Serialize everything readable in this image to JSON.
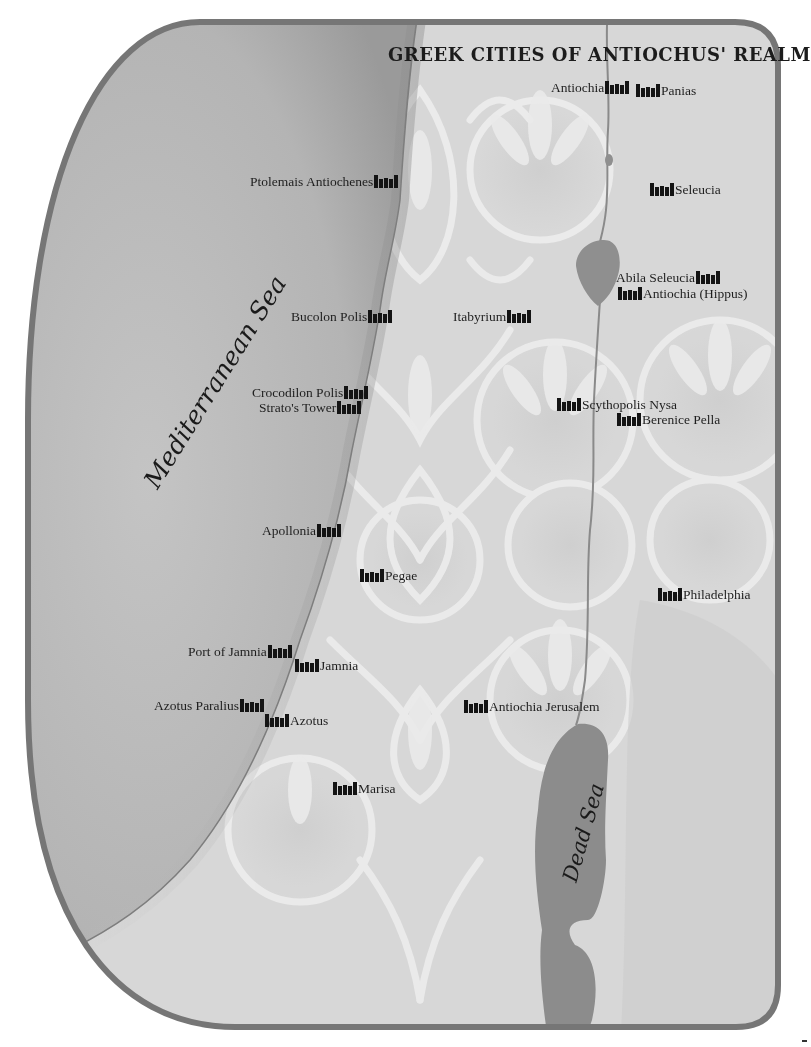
{
  "map": {
    "title": "GREEK CITIES OF ANTIOCHUS' REALM",
    "colors": {
      "frame_border": "#767676",
      "sea": "#b9b9b9",
      "land": "#d6d6d6",
      "ornament": "#e9e9e9",
      "lake": "#8f8f8f",
      "river": "#8a8a8a",
      "text": "#1e1e1e"
    },
    "water_bodies": [
      {
        "name": "Mediterranean Sea"
      },
      {
        "name": "Dead Sea"
      }
    ],
    "icons": {
      "city_marker": "fortress-icon"
    },
    "cities": [
      {
        "name": "Antiochia",
        "side": "left",
        "x": 550,
        "y": 80
      },
      {
        "name": "Panias",
        "side": "right",
        "x": 636,
        "y": 83
      },
      {
        "name": "Ptolemais Antiochenes",
        "side": "left",
        "x": 249,
        "y": 173
      },
      {
        "name": "Seleucia",
        "side": "right",
        "x": 650,
        "y": 181
      },
      {
        "name": "Abila Seleucia",
        "side": "left",
        "x": 615,
        "y": 270
      },
      {
        "name": "Antiochia (Hippus)",
        "side": "right",
        "x": 618,
        "y": 286
      },
      {
        "name": "Bucolon Polis",
        "side": "left",
        "x": 290,
        "y": 308
      },
      {
        "name": "Itabyrium",
        "side": "left",
        "x": 452,
        "y": 308
      },
      {
        "name": "Crocodilon Polis",
        "side": "left",
        "x": 251,
        "y": 385
      },
      {
        "name": "Strato's Tower",
        "side": "left",
        "x": 258,
        "y": 400
      },
      {
        "name": "Scythopolis Nysa",
        "side": "right",
        "x": 557,
        "y": 397
      },
      {
        "name": "Berenice Pella",
        "side": "right",
        "x": 617,
        "y": 412
      },
      {
        "name": "Apollonia",
        "side": "left",
        "x": 261,
        "y": 523
      },
      {
        "name": "Pegae",
        "side": "right",
        "x": 360,
        "y": 568
      },
      {
        "name": "Philadelphia",
        "side": "right",
        "x": 658,
        "y": 587
      },
      {
        "name": "Port of Jamnia",
        "side": "left",
        "x": 187,
        "y": 644
      },
      {
        "name": "Jamnia",
        "side": "right",
        "x": 295,
        "y": 658
      },
      {
        "name": "Azotus Paralius",
        "side": "left",
        "x": 153,
        "y": 697
      },
      {
        "name": "Azotus",
        "side": "right",
        "x": 265,
        "y": 713
      },
      {
        "name": "Antiochia Jerusalem",
        "side": "right",
        "x": 464,
        "y": 699
      },
      {
        "name": "Marisa",
        "side": "right",
        "x": 333,
        "y": 780
      }
    ]
  }
}
